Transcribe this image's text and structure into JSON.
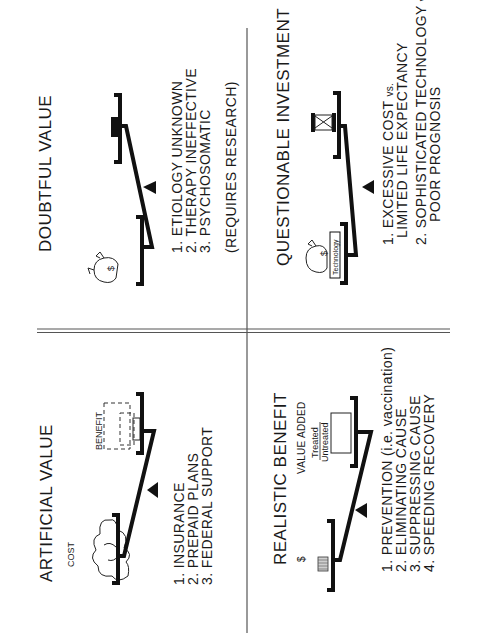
{
  "quadrants": {
    "artificial_value": {
      "title": "ARTIFICIAL  VALUE",
      "left_label": "COST",
      "right_label": "BENEFIT",
      "items": [
        "1. INSURANCE",
        "2. PREPAID  PLANS",
        "3. FEDERAL  SUPPORT"
      ]
    },
    "realistic_benefit": {
      "title": "REALISTIC  BENEFIT",
      "left_label": "$",
      "right_label": "VALUE  ADDED",
      "fraction_top": "Treated",
      "fraction_bottom": "Untreated",
      "items": [
        "1. PREVENTION   (i.e. vaccination)",
        "2. ELIMINATING  CAUSE",
        "3. SUPPRESSING  CAUSE",
        "4. SPEEDING  RECOVERY"
      ]
    },
    "doubtful_value": {
      "title": "DOUBTFUL  VALUE",
      "bag_label": "$",
      "items": [
        "1. ETIOLOGY  UNKNOWN",
        "2. THERAPY  INEFFECTIVE",
        "3. PSYCHOSOMATIC"
      ],
      "note": "(REQUIRES  RESEARCH)"
    },
    "questionable_investment": {
      "title": "QUESTIONABLE  INVESTMENT",
      "bag_label": "$",
      "box_label": "Technology",
      "items": [
        {
          "line1": "1. EXCESSIVE  COST",
          "vs": "vs.",
          "line2": "LIMITED  LIFE  EXPECTANCY"
        },
        {
          "line1": "2. SOPHISTICATED  TECHNOLOGY",
          "vs": "vs.",
          "line2": "POOR  PROGNOSIS"
        }
      ]
    }
  },
  "icons": {
    "cost": "cloud-icon",
    "money": "money-bag-icon",
    "coins": "coin-stack-icon",
    "time": "hourglass-icon",
    "fulcrum": "triangle-fulcrum-icon"
  }
}
